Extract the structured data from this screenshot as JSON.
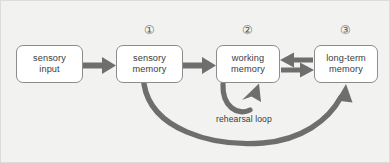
{
  "diagram": {
    "background_color": "#f2f2f1",
    "frame_border_color": "#dcdcda",
    "node_border_color": "#8c8c8c",
    "node_fill_color": "#ffffff",
    "arrow_color": "#6e6e6e",
    "curve_color": "#6e6e6e",
    "text_color": "#3b3b3b",
    "marker_color": "#5f5f5f",
    "nodes": [
      {
        "id": "sensory-input",
        "line1": "sensory",
        "line2": "input",
        "marker": ""
      },
      {
        "id": "sensory-memory",
        "line1": "sensory",
        "line2": "memory",
        "marker": "①"
      },
      {
        "id": "working-memory",
        "line1": "working",
        "line2": "memory",
        "marker": "②"
      },
      {
        "id": "long-term-memory",
        "line1": "long-term",
        "line2": "memory",
        "marker": "③"
      }
    ],
    "connectors": [
      {
        "id": "input-to-sensory",
        "kind": "straight-arrow",
        "direction": "right",
        "from": "sensory-input",
        "to": "sensory-memory"
      },
      {
        "id": "sensory-to-working",
        "kind": "straight-arrow",
        "direction": "right",
        "from": "sensory-memory",
        "to": "working-memory"
      },
      {
        "id": "working-longterm-top",
        "kind": "straight-arrow",
        "direction": "left",
        "from": "long-term-memory",
        "to": "working-memory"
      },
      {
        "id": "working-longterm-bottom",
        "kind": "straight-arrow",
        "direction": "right",
        "from": "working-memory",
        "to": "long-term-memory"
      },
      {
        "id": "retrieval-curve",
        "kind": "curved-arrow",
        "direction": "up-right",
        "from": "sensory-memory",
        "to": "long-term-memory"
      },
      {
        "id": "rehearsal-loop-arrow",
        "kind": "u-loop-arrow",
        "direction": "up-right",
        "from": "working-memory",
        "to": "working-memory"
      }
    ],
    "labels": {
      "rehearsal_loop": "rehearsal loop"
    }
  }
}
